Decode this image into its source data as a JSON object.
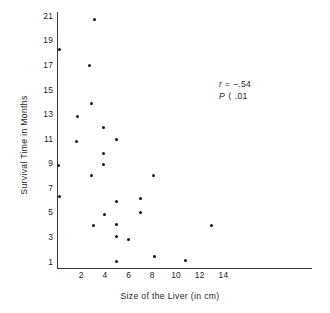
{
  "chart_data": {
    "type": "scatter",
    "title": "",
    "xlabel": "Size of the Liver (in cm)",
    "ylabel": "Survival Time in Months",
    "xlim": [
      0,
      15.5
    ],
    "ylim": [
      0,
      21.8
    ],
    "xticks": [
      2,
      4,
      6,
      8,
      10,
      12,
      14
    ],
    "yticks": [
      1,
      3,
      5,
      7,
      9,
      11,
      13,
      15,
      17,
      19,
      21
    ],
    "grid": false,
    "legend": null,
    "points": [
      {
        "x": 3.1,
        "y": 20.7
      },
      {
        "x": 0.15,
        "y": 18.3
      },
      {
        "x": 2.7,
        "y": 17.0
      },
      {
        "x": 2.9,
        "y": 13.9
      },
      {
        "x": 1.7,
        "y": 12.8
      },
      {
        "x": 3.9,
        "y": 11.9
      },
      {
        "x": 5.0,
        "y": 10.9
      },
      {
        "x": 1.6,
        "y": 10.8
      },
      {
        "x": 3.9,
        "y": 9.8
      },
      {
        "x": 0.1,
        "y": 8.8
      },
      {
        "x": 3.9,
        "y": 8.9
      },
      {
        "x": 2.9,
        "y": 8.0
      },
      {
        "x": 8.1,
        "y": 8.0
      },
      {
        "x": 0.2,
        "y": 6.3
      },
      {
        "x": 7.0,
        "y": 6.1
      },
      {
        "x": 5.0,
        "y": 5.9
      },
      {
        "x": 7.0,
        "y": 5.0
      },
      {
        "x": 4.0,
        "y": 4.85
      },
      {
        "x": 5.0,
        "y": 4.0
      },
      {
        "x": 3.0,
        "y": 3.9
      },
      {
        "x": 13.0,
        "y": 3.9
      },
      {
        "x": 5.0,
        "y": 3.0
      },
      {
        "x": 6.0,
        "y": 2.8
      },
      {
        "x": 8.2,
        "y": 1.4
      },
      {
        "x": 10.8,
        "y": 1.1
      },
      {
        "x": 5.0,
        "y": 1.0
      }
    ],
    "annotations": {
      "correlation_symbol": "r",
      "correlation_text": "= −.54",
      "pvalue_symbol": "P",
      "pvalue_text": "⟨ .01"
    }
  },
  "axes": {
    "y_tick_labels": [
      "21",
      "19",
      "17",
      "15",
      "13",
      "11",
      "9",
      "7",
      "5",
      "3",
      "1"
    ],
    "x_tick_labels": [
      "2",
      "4",
      "6",
      "8",
      "10",
      "12",
      "14"
    ],
    "y_axis_title": "Survival Time in Months",
    "x_axis_title": "Size of the Liver (in cm)"
  },
  "colors": {
    "point": "#111111",
    "axis": "#3a3a3a",
    "text": "#1c1c1c",
    "background": "#ffffff"
  }
}
